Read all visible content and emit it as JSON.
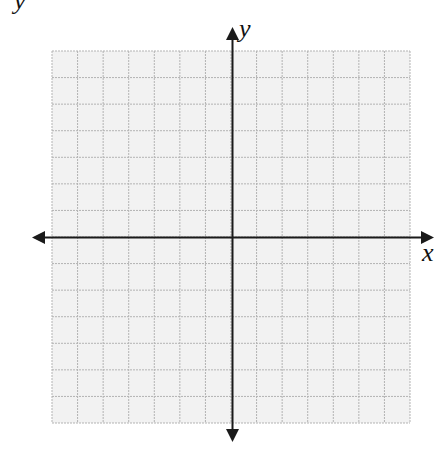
{
  "header": {
    "cropped_text": "y"
  },
  "plane": {
    "x_axis_label": "x",
    "y_axis_label": "y",
    "grid_columns": 14,
    "grid_rows": 14,
    "cells_left_of_y_axis": 7,
    "cells_right_of_y_axis": 7,
    "cells_above_x_axis": 7,
    "cells_below_x_axis": 7,
    "colors": {
      "grid_fill": "#f2f2f2",
      "grid_line": "#b3b3b3",
      "axis": "#1a1a1a"
    }
  }
}
